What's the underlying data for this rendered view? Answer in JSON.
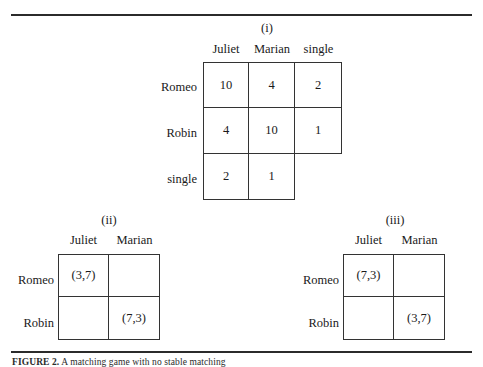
{
  "figure": {
    "caption_label": "FIGURE 2.",
    "caption_text": "A matching game with no stable matching",
    "rules": {
      "top": "horizontal-rule",
      "bottom": "horizontal-rule"
    }
  },
  "panels": [
    {
      "id": "i",
      "title": "(i)",
      "columns": [
        "Juliet",
        "Marian",
        "single"
      ],
      "rows": [
        "Romeo",
        "Robin",
        "single"
      ],
      "cells": [
        [
          "10",
          "4",
          "2"
        ],
        [
          "4",
          "10",
          "1"
        ],
        [
          "2",
          "1",
          null
        ]
      ]
    },
    {
      "id": "ii",
      "title": "(ii)",
      "columns": [
        "Juliet",
        "Marian"
      ],
      "rows": [
        "Romeo",
        "Robin"
      ],
      "cells": [
        [
          "(3,7)",
          ""
        ],
        [
          "",
          "(7,3)"
        ]
      ]
    },
    {
      "id": "iii",
      "title": "(iii)",
      "columns": [
        "Juliet",
        "Marian"
      ],
      "rows": [
        "Romeo",
        "Robin"
      ],
      "cells": [
        [
          "(7,3)",
          ""
        ],
        [
          "",
          "(3,7)"
        ]
      ]
    }
  ]
}
